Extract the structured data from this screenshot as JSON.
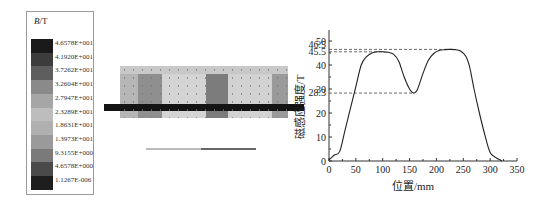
{
  "legend": {
    "title_var": "B",
    "title_unit": "/T",
    "levels": [
      "4.6578E+001",
      "4.1920E+001",
      "3.7262E+001",
      "3.2604E+001",
      "2.7947E+001",
      "2.3289E+001",
      "1.8631E+001",
      "1.3973E+001",
      "9.3155E+000",
      "4.6578E+000",
      "1.1267E-006"
    ],
    "colors": [
      "#1a1a1a",
      "#3c3c3c",
      "#5e5e5e",
      "#8a8a8a",
      "#a6a6a6",
      "#bdbdbd",
      "#b0b0b0",
      "#9a9a9a",
      "#7a7a7a",
      "#4a4a4a",
      "#1e1e1e"
    ]
  },
  "simulation": {
    "bands": [
      {
        "left": 0,
        "width": 18,
        "color": "#b6b6b6"
      },
      {
        "left": 18,
        "width": 24,
        "color": "#8f8f8f"
      },
      {
        "left": 42,
        "width": 44,
        "color": "#d4d4d4"
      },
      {
        "left": 86,
        "width": 22,
        "color": "#7c7c7c"
      },
      {
        "left": 108,
        "width": 44,
        "color": "#d2d2d2"
      },
      {
        "left": 152,
        "width": 16,
        "color": "#9a9a9a"
      }
    ]
  },
  "chart_data": {
    "type": "line",
    "title": "",
    "xlabel": "位置/mm",
    "ylabel": "磁感应强度/T",
    "xlim": [
      0,
      350
    ],
    "ylim": [
      0,
      50
    ],
    "xticks": [
      0,
      50,
      100,
      150,
      200,
      250,
      300,
      350
    ],
    "yticks": [
      0,
      10,
      20,
      30,
      40,
      50
    ],
    "annotated_levels": [
      46.5,
      45.5,
      28.3
    ],
    "annotated_labels": [
      "46.5",
      "45.5",
      "28.3"
    ],
    "grid": false,
    "x": [
      0,
      5,
      10,
      20,
      30,
      40,
      50,
      60,
      70,
      80,
      90,
      100,
      110,
      120,
      130,
      140,
      150,
      158,
      165,
      175,
      185,
      195,
      205,
      215,
      225,
      235,
      245,
      255,
      262,
      270,
      280,
      290,
      300,
      310,
      318,
      322
    ],
    "series": [
      {
        "name": "磁感应强度",
        "values": [
          0.5,
          1.5,
          2.5,
          4.0,
          13.0,
          22.0,
          31.0,
          40.0,
          43.5,
          45.0,
          45.5,
          45.5,
          45.3,
          44.5,
          41.5,
          35.0,
          30.0,
          28.3,
          30.0,
          36.5,
          42.0,
          44.8,
          46.0,
          46.4,
          46.5,
          46.4,
          45.8,
          43.5,
          39.0,
          30.0,
          20.0,
          11.0,
          3.5,
          1.5,
          0.5,
          0.0
        ]
      }
    ]
  }
}
